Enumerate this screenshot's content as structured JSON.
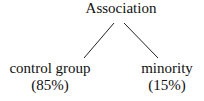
{
  "diagram": {
    "type": "tree",
    "root": {
      "label": "Association"
    },
    "children": [
      {
        "label": "control group",
        "value": "(85%)"
      },
      {
        "label": "minority",
        "value": "(15%)"
      }
    ],
    "line_color": "#222222"
  }
}
